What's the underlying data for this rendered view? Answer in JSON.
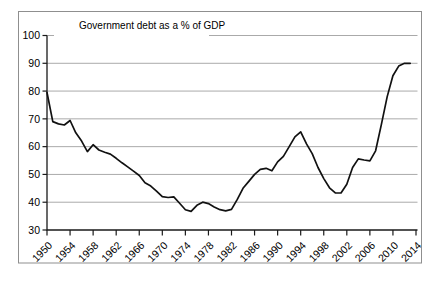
{
  "figure": {
    "title": "Government debt as a % of GDP"
  },
  "chart_data": {
    "type": "line",
    "title": "Government debt as a % of GDP",
    "xlabel": "",
    "ylabel": "",
    "series_name": "Government debt as a % of GDP",
    "x": [
      1950,
      1951,
      1952,
      1953,
      1954,
      1955,
      1956,
      1957,
      1958,
      1959,
      1960,
      1961,
      1962,
      1963,
      1964,
      1965,
      1966,
      1967,
      1968,
      1969,
      1970,
      1971,
      1972,
      1973,
      1974,
      1975,
      1976,
      1977,
      1978,
      1979,
      1980,
      1981,
      1982,
      1983,
      1984,
      1985,
      1986,
      1987,
      1988,
      1989,
      1990,
      1991,
      1992,
      1993,
      1994,
      1995,
      1996,
      1997,
      1998,
      1999,
      2000,
      2001,
      2002,
      2003,
      2004,
      2005,
      2006,
      2007,
      2008,
      2009,
      2010,
      2011,
      2012,
      2013
    ],
    "values": [
      79.5,
      69.0,
      68.2,
      67.8,
      69.4,
      65.0,
      62.0,
      58.2,
      60.7,
      58.8,
      58.0,
      57.3,
      55.8,
      54.2,
      52.7,
      51.2,
      49.6,
      47.0,
      45.8,
      44.0,
      42.0,
      41.7,
      41.9,
      39.6,
      37.3,
      36.7,
      38.9,
      40.0,
      39.5,
      38.3,
      37.3,
      36.9,
      37.4,
      41.0,
      45.0,
      47.5,
      50.0,
      51.8,
      52.2,
      51.3,
      54.5,
      56.5,
      60.0,
      63.5,
      65.3,
      61.0,
      57.5,
      52.5,
      48.5,
      45.2,
      43.4,
      43.3,
      46.5,
      52.5,
      55.6,
      55.2,
      54.9,
      58.5,
      68.0,
      78.0,
      85.5,
      89.0,
      90.0,
      90.0
    ],
    "xlim": [
      1950,
      2014
    ],
    "ylim": [
      30,
      100
    ],
    "x_ticks": [
      1950,
      1954,
      1958,
      1962,
      1966,
      1970,
      1974,
      1978,
      1982,
      1986,
      1990,
      1994,
      1998,
      2002,
      2006,
      2010,
      2014
    ],
    "y_ticks": [
      30,
      40,
      50,
      60,
      70,
      80,
      90,
      100
    ],
    "grid": "horizontal",
    "legend_position": "none",
    "colors": {
      "line": "#111111",
      "axis": "#1a1a1a",
      "gridline": "#aaaaaa",
      "figure_border": "#8f8f8f",
      "background": "#ffffff",
      "text": "#000000"
    }
  }
}
